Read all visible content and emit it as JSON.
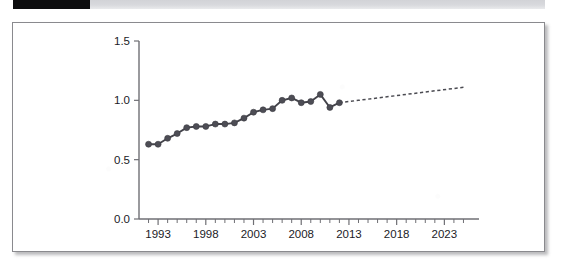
{
  "header": {
    "black_block_label": "",
    "gray_bar_label": ""
  },
  "chart_data": {
    "type": "line",
    "title": "",
    "subtitle": "",
    "xlabel": "",
    "ylabel": "",
    "xlim": [
      1991,
      2026
    ],
    "ylim": [
      0.0,
      1.5
    ],
    "grid": false,
    "legend": "none",
    "y_ticks": [
      "0.0",
      "0.5",
      "1.0",
      "1.5"
    ],
    "y_tick_values": [
      0.0,
      0.5,
      1.0,
      1.5
    ],
    "x_ticks": [
      "1993",
      "1998",
      "2003",
      "2008",
      "2013",
      "2018",
      "2023"
    ],
    "x_tick_values": [
      1993,
      1998,
      2003,
      2008,
      2013,
      2018,
      2023
    ],
    "x_minor_ticks": [
      1992,
      1994,
      1995,
      1996,
      1997,
      1999,
      2000,
      2001,
      2002,
      2004,
      2005,
      2006,
      2007,
      2009,
      2010,
      2011,
      2012,
      2014,
      2015,
      2016,
      2017,
      2019,
      2020,
      2021,
      2022,
      2024,
      2025
    ],
    "series": [
      {
        "name": "observed",
        "style": "solid-with-markers",
        "color": "#4d4d55",
        "x": [
          1992,
          1993,
          1994,
          1995,
          1996,
          1997,
          1998,
          1999,
          2000,
          2001,
          2002,
          2003,
          2004,
          2005,
          2006,
          2007,
          2008,
          2009,
          2010,
          2011,
          2012
        ],
        "values": [
          0.63,
          0.63,
          0.68,
          0.72,
          0.77,
          0.78,
          0.78,
          0.8,
          0.8,
          0.81,
          0.85,
          0.9,
          0.92,
          0.93,
          1.0,
          1.02,
          0.98,
          0.99,
          1.05,
          0.94,
          0.98
        ]
      },
      {
        "name": "projection",
        "style": "dashed",
        "color": "#4a4a51",
        "x": [
          2012,
          2014,
          2016,
          2018,
          2020,
          2022,
          2024,
          2025
        ],
        "values": [
          0.98,
          1.0,
          1.02,
          1.04,
          1.06,
          1.08,
          1.1,
          1.11
        ]
      }
    ]
  }
}
